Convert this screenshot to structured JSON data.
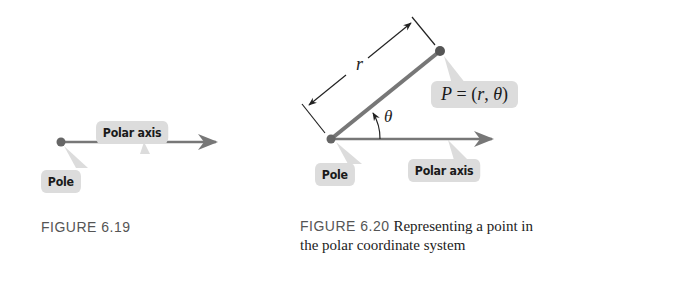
{
  "figure_6_19": {
    "labels": {
      "polar_axis": "Polar axis",
      "pole": "Pole"
    },
    "caption": {
      "number": "FIGURE 6.19",
      "text": ""
    }
  },
  "figure_6_20": {
    "labels": {
      "r": "r",
      "point": "P = (r, θ)",
      "point_P": "P",
      "point_eq": " = (",
      "point_r": "r",
      "point_comma": ", ",
      "point_theta": "θ",
      "point_close": ")",
      "theta": "θ",
      "pole": "Pole",
      "polar_axis": "Polar axis"
    },
    "caption": {
      "number": "FIGURE 6.20",
      "text": "Representing a point in",
      "text_line2": "the polar coordinate system"
    }
  },
  "colors": {
    "ray": "#777777",
    "point": "#666666",
    "callout_bg": "#dcdcdc",
    "text": "#1a1a1a"
  }
}
